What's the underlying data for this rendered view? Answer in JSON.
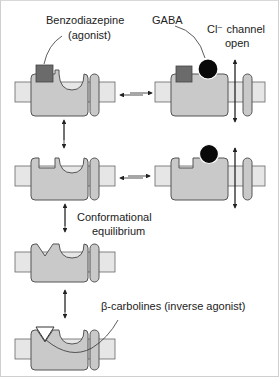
{
  "labels": {
    "benzodiazepine": "Benzodiazepine",
    "agonist": "(agonist)",
    "gaba": "GABA",
    "cl_channel_line1": "Cl⁻ channel",
    "cl_channel_line2": "open",
    "conformational_line1": "Conformational",
    "conformational_line2": "equilibrium",
    "beta_carbolines": "β-carbolines (inverse agonist)"
  },
  "colors": {
    "receptor_fill": "#c9c9c9",
    "receptor_stroke": "#555555",
    "membrane_fill": "#e6e6e6",
    "benzodiazepine_fill": "#6b6b6b",
    "gaba_fill": "#0a0a0a"
  }
}
